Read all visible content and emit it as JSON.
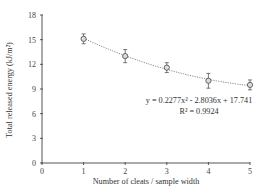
{
  "chart_data": {
    "type": "scatter",
    "title": "",
    "xlabel": "Number of cleats / sample width",
    "ylabel": "Total released energy (kJ/m²)",
    "xlim": [
      0,
      5
    ],
    "ylim": [
      0,
      18
    ],
    "x_ticks": [
      0,
      1,
      2,
      3,
      4,
      5
    ],
    "y_ticks": [
      0,
      3,
      6,
      9,
      12,
      15,
      18
    ],
    "grid": false,
    "legend": null,
    "series": [
      {
        "name": "Total released energy",
        "marker": "open-circle-with-errorbars",
        "x": [
          1,
          2,
          3,
          4,
          5
        ],
        "y": [
          15.1,
          13.0,
          11.6,
          10.0,
          9.5
        ],
        "error": [
          0.6,
          0.8,
          0.6,
          0.9,
          0.6
        ]
      }
    ],
    "trendline": {
      "type": "polynomial-2",
      "style": "dotted",
      "coefficients": [
        0.2277,
        -2.8036,
        17.741
      ],
      "x_range": [
        1,
        5
      ]
    },
    "annotations": [
      "y = 0.2277x² - 2.8036x + 17.741",
      "R² = 0.9924"
    ]
  },
  "labels": {
    "equation": "y = 0.2277x² - 2.8036x + 17.741",
    "r_squared": "R² = 0.9924"
  }
}
